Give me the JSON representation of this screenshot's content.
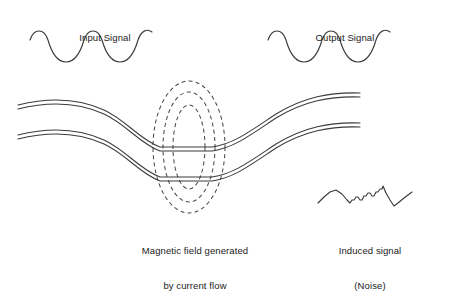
{
  "figure": {
    "background_color": "#ffffff",
    "line_color": "#3b3b3b",
    "dash_color": "#4a4a4a"
  },
  "labels": {
    "input_signal": "Input Signal",
    "output_signal": "Output Signal"
  },
  "captions": {
    "magnetic_field": {
      "line1": "Magnetic field generated",
      "line2": "by current flow"
    },
    "induced_signal": {
      "line1": "Induced signal",
      "line2": "(Noise)"
    }
  },
  "chart_data": {
    "type": "line",
    "xlabel": "",
    "ylabel": "",
    "grid": false,
    "legend_position": "none",
    "series": [
      {
        "name": "Input Signal",
        "style": "smooth-sine",
        "cycles": 2.5,
        "amplitude": 13,
        "x_range": [
          30,
          155
        ],
        "baseline_y": 47,
        "start_phase": "trough-rising",
        "path": "M 30 40 C 34 28 44 28 48 40 C 52 54 58 62 66 62 C 74 62 80 54 84 40 C 88 28 98 28 102 40 C 106 54 112 62 120 62 C 128 62 134 54 138 40 C 141 31 147 28 152 32"
      },
      {
        "name": "Output Signal",
        "style": "smooth-sine",
        "cycles": 2.5,
        "amplitude": 13,
        "x_range": [
          268,
          393
        ],
        "baseline_y": 47,
        "start_phase": "trough-rising",
        "path": "M 268 40 C 272 28 282 28 286 40 C 290 54 296 62 304 62 C 312 62 318 54 322 40 C 326 28 336 28 340 40 C 344 54 350 62 358 62 C 366 62 372 54 376 40 C 379 31 385 28 390 32"
      },
      {
        "name": "Induced signal (Noise)",
        "style": "jagged-staircase",
        "x_range": [
          318,
          412
        ],
        "baseline_y": 200,
        "path": "M 318 203 L 324 197 L 330 192 L 336 190 L 342 194 L 347 200 L 350 203 L 352 200 L 354 200 L 356 197 L 358 197 L 360 200 L 362 200 L 364 196 L 366 196 L 368 193 L 370 193 L 372 196 L 374 196 L 376 192 L 378 192 L 380 189 L 382 189 L 383 186 L 386 193 L 390 200 L 394 206 L 398 203 L 404 198 L 412 192"
      }
    ],
    "conductors": [
      {
        "name": "upper-conductor",
        "description": "Upper cable drawn as two parallel lines with an S-bend dip through the field region",
        "center_path": "M 18 107 C 50 99 78 100 104 112 C 126 122 140 142 160 149 L 212 149 C 234 146 252 132 276 116 C 304 99 330 94 360 95",
        "offset": 4
      },
      {
        "name": "lower-conductor",
        "description": "Lower cable drawn as two parallel lines with an S-bend dip through the field region",
        "center_path": "M 18 137 C 50 129 78 130 104 142 C 126 152 140 172 160 179 L 212 179 C 234 176 252 162 276 146 C 304 129 330 124 360 125",
        "offset": 4
      }
    ],
    "field_lines": {
      "name": "magnetic-field",
      "description": "Three concentric dashed ellipses centred between the two conductors",
      "center": [
        189,
        147
      ],
      "count": 3,
      "ellipses": [
        {
          "rx": 16,
          "ry": 42
        },
        {
          "rx": 26,
          "ry": 55
        },
        {
          "rx": 36,
          "ry": 66
        }
      ]
    },
    "annotations": [
      {
        "text": "Input Signal",
        "position": [
          105,
          16
        ]
      },
      {
        "text": "Output Signal",
        "position": [
          345,
          16
        ]
      },
      {
        "text": "Magnetic field generated",
        "position": [
          195,
          228
        ]
      },
      {
        "text": "by current flow",
        "position": [
          195,
          240
        ]
      },
      {
        "text": "Induced signal",
        "position": [
          370,
          228
        ]
      },
      {
        "text": "(Noise)",
        "position": [
          370,
          240
        ]
      }
    ]
  }
}
